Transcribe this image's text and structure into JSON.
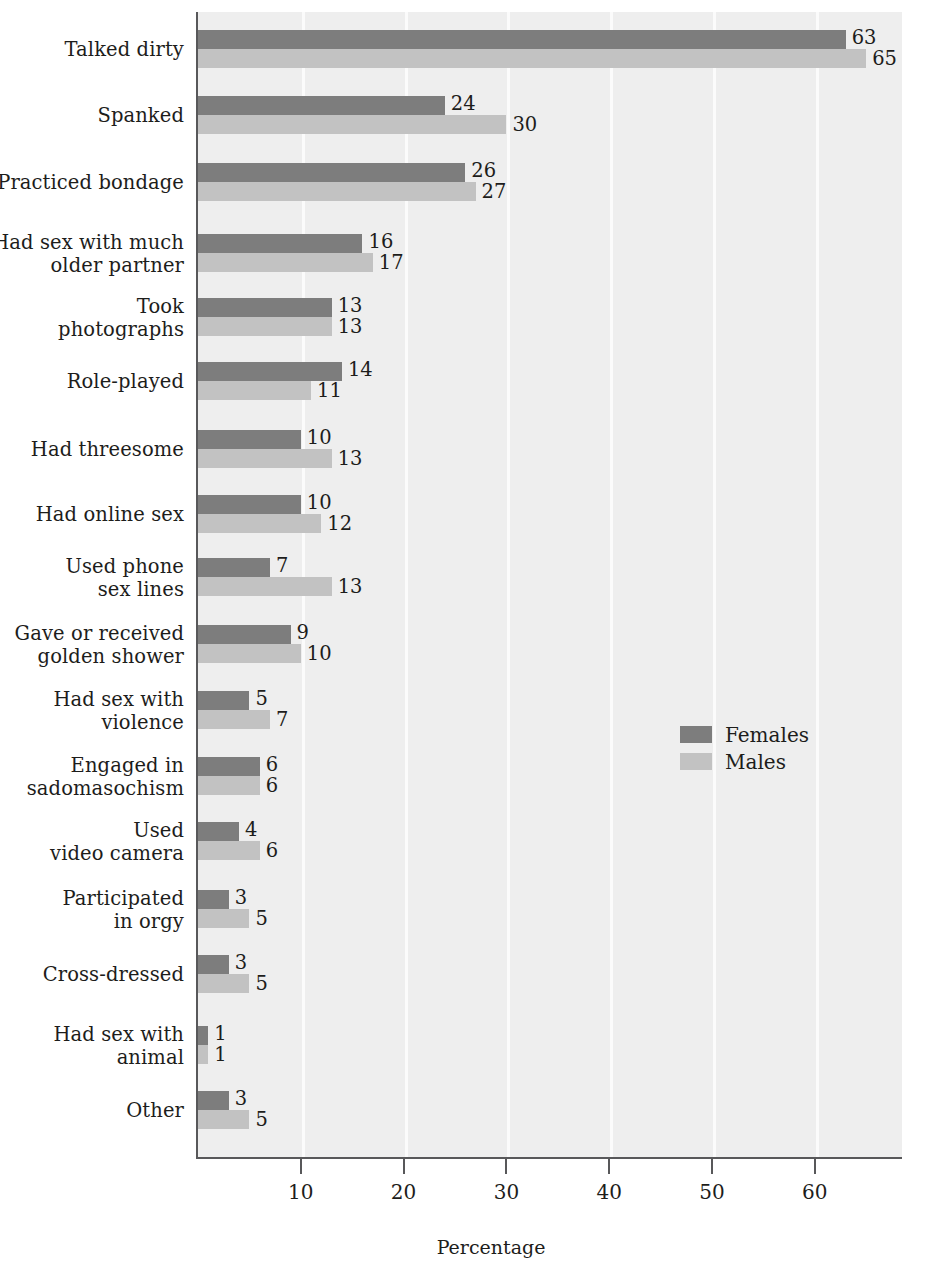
{
  "chart_data": {
    "type": "bar",
    "orientation": "horizontal",
    "title": "",
    "xlabel": "Percentage",
    "ylabel": "",
    "xlim": [
      0,
      68
    ],
    "xticks": [
      10,
      20,
      30,
      40,
      50,
      60
    ],
    "grid": "vertical",
    "legend_position": "middle-right",
    "categories": [
      "Talked dirty",
      "Spanked",
      "Practiced bondage",
      "Had sex with much older partner",
      "Took photographs",
      "Role-played",
      "Had threesome",
      "Had online sex",
      "Used phone sex lines",
      "Gave or received golden shower",
      "Had sex with violence",
      "Engaged in sadomasochism",
      "Used video camera",
      "Participated in orgy",
      "Cross-dressed",
      "Had sex with animal",
      "Other"
    ],
    "series": [
      {
        "name": "Females",
        "color": "#7d7d7d",
        "values": [
          63,
          24,
          26,
          16,
          13,
          14,
          10,
          10,
          7,
          9,
          5,
          6,
          4,
          3,
          3,
          1,
          3
        ]
      },
      {
        "name": "Males",
        "color": "#c2c2c2",
        "values": [
          65,
          30,
          27,
          17,
          13,
          11,
          13,
          12,
          13,
          10,
          7,
          6,
          6,
          5,
          5,
          1,
          5
        ]
      }
    ]
  },
  "rows": [
    {
      "line1": "Talked dirty",
      "line2": "",
      "female": 63,
      "male": 65,
      "top": 30
    },
    {
      "line1": "Spanked",
      "line2": "",
      "female": 24,
      "male": 30,
      "top": 96
    },
    {
      "line1": "Practiced bondage",
      "line2": "",
      "female": 26,
      "male": 27,
      "top": 163
    },
    {
      "line1": "Had sex with much",
      "line2": "older partner",
      "female": 16,
      "male": 17,
      "top": 234
    },
    {
      "line1": "Took",
      "line2": "photographs",
      "female": 13,
      "male": 13,
      "top": 298
    },
    {
      "line1": "Role-played",
      "line2": "",
      "female": 14,
      "male": 11,
      "top": 362
    },
    {
      "line1": "Had threesome",
      "line2": "",
      "female": 10,
      "male": 13,
      "top": 430
    },
    {
      "line1": "Had online sex",
      "line2": "",
      "female": 10,
      "male": 12,
      "top": 495
    },
    {
      "line1": "Used phone",
      "line2": "sex lines",
      "female": 7,
      "male": 13,
      "top": 558
    },
    {
      "line1": "Gave or received",
      "line2": "golden shower",
      "female": 9,
      "male": 10,
      "top": 625
    },
    {
      "line1": "Had sex with",
      "line2": "violence",
      "female": 5,
      "male": 7,
      "top": 691
    },
    {
      "line1": "Engaged in",
      "line2": "sadomasochism",
      "female": 6,
      "male": 6,
      "top": 757
    },
    {
      "line1": "Used",
      "line2": "video camera",
      "female": 4,
      "male": 6,
      "top": 822
    },
    {
      "line1": "Participated",
      "line2": "in orgy",
      "female": 3,
      "male": 5,
      "top": 890
    },
    {
      "line1": "Cross-dressed",
      "line2": "",
      "female": 3,
      "male": 5,
      "top": 955
    },
    {
      "line1": "Had sex with",
      "line2": "animal",
      "female": 1,
      "male": 1,
      "top": 1026
    },
    {
      "line1": "Other",
      "line2": "",
      "female": 3,
      "male": 5,
      "top": 1091
    }
  ],
  "legend": {
    "females_label": "Females",
    "males_label": "Males"
  },
  "axis": {
    "title": "Percentage",
    "ticks": [
      "10",
      "20",
      "30",
      "40",
      "50",
      "60"
    ]
  },
  "colors": {
    "female_bar": "#7d7d7d",
    "male_bar": "#c2c2c2",
    "plot_background": "#eeeeee",
    "gridline": "#fbfbfb",
    "axis_line": "#58585a",
    "text": "#1d1d1b"
  }
}
